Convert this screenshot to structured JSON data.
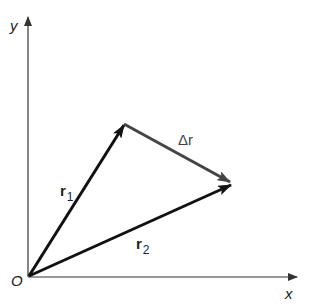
{
  "diagram": {
    "type": "vector-displacement",
    "colors": {
      "axes": "#333333",
      "position_vectors": "#111111",
      "displacement_vector": "#444444",
      "background": "#ffffff"
    },
    "axes": {
      "x_label": "x",
      "y_label": "y",
      "origin_label": "O"
    },
    "vectors": [
      {
        "name": "r1",
        "label_main": "r",
        "label_sub": "1",
        "from": "O",
        "to": "P1"
      },
      {
        "name": "r2",
        "label_main": "r",
        "label_sub": "2",
        "from": "O",
        "to": "P2"
      },
      {
        "name": "delta-r",
        "label_main": "Δr",
        "label_sub": "",
        "from": "P1",
        "to": "P2"
      }
    ]
  }
}
